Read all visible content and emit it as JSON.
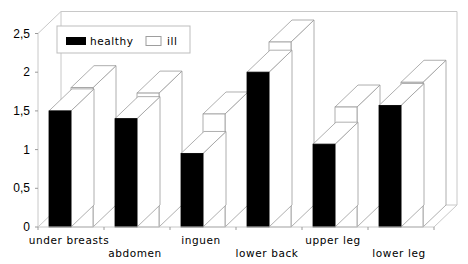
{
  "chart_data": {
    "type": "bar",
    "style": "3d-clustered-column",
    "title": "",
    "xlabel": "",
    "ylabel": "",
    "categories": [
      "under breasts",
      "abdomen",
      "inguen",
      "lower back",
      "upper leg",
      "lower leg"
    ],
    "series": [
      {
        "name": "healthy",
        "color": "#000000",
        "values": [
          1.5,
          1.4,
          0.95,
          2.0,
          1.07,
          1.57
        ]
      },
      {
        "name": "ill",
        "color": "#ffffff",
        "values": [
          1.8,
          1.73,
          1.46,
          2.39,
          1.55,
          1.87
        ]
      }
    ],
    "ylim": [
      0,
      2.5
    ],
    "yticks": [
      0,
      0.5,
      1,
      1.5,
      2,
      2.5
    ],
    "ytick_labels": [
      "0",
      "0,5",
      "1",
      "1,5",
      "2",
      "2,5"
    ],
    "grid": false,
    "legend": {
      "position": "top-left-inside",
      "entries": [
        "healthy",
        "ill"
      ]
    }
  }
}
